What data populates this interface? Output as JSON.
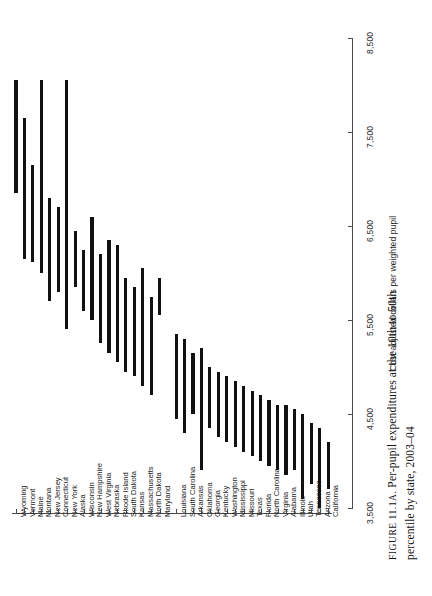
{
  "figure": {
    "caption_label": "FIGURE 11.1A.",
    "caption_line1": "Per-pupil expenditures at the 10th to 50th",
    "caption_line2": "percentile by state, 2003–04"
  },
  "chart_data": {
    "type": "bar",
    "orientation": "range-bars-rotated",
    "xlabel": "",
    "ylabel": "Cost-adjusted dollars per weighted pupil",
    "value_axis_label": "Cost-adjusted dollars per weighted pupil",
    "ylim": [
      3500,
      8500
    ],
    "ticks": [
      "3,500",
      "4,500",
      "5,500",
      "6,500",
      "7,500",
      "8,500"
    ],
    "tick_values": [
      3500,
      4500,
      5500,
      6500,
      7500,
      8500
    ],
    "grid": false,
    "legend": "none",
    "series_note": "Each bar spans the 10th percentile (low) to the 50th percentile (high) of cost-adjusted per-pupil expenditure for unified districts in that state.",
    "categories": [
      "Wyoming",
      "Vermont",
      "Maine",
      "Montana",
      "New Jersey",
      "Connecticut",
      "New York",
      "Alaska",
      "Wisconsin",
      "New Hampshire",
      "West Virginia",
      "Nebraska",
      "Rhode Island",
      "South Dakota",
      "Kansas",
      "Massachusetts",
      "North Dakota",
      "Maryland",
      "Louisiana",
      "South Carolina",
      "Arkansas",
      "Oklahoma",
      "Georgia",
      "Kentucky",
      "Washington",
      "Mississippi",
      "Missouri",
      "Texas",
      "Florida",
      "North Carolina",
      "Virginia",
      "Alabama",
      "Illinois",
      "Utah",
      "Tennessee",
      "Arizona",
      "California"
    ],
    "low_values": [
      6850,
      6150,
      6120,
      6000,
      5700,
      5800,
      5400,
      5850,
      5600,
      5500,
      5250,
      5150,
      5050,
      4950,
      4900,
      4800,
      4700,
      5550,
      4450,
      4300,
      4500,
      3900,
      4350,
      4250,
      4200,
      4150,
      4100,
      4050,
      4000,
      3950,
      3900,
      3850,
      3900,
      3600,
      3750,
      3500,
      3700
    ],
    "high_values": [
      8050,
      7650,
      7150,
      8050,
      6800,
      6700,
      8050,
      6450,
      6250,
      6600,
      6200,
      6350,
      6300,
      5950,
      5850,
      6050,
      5750,
      5950,
      5350,
      5300,
      5150,
      5200,
      5000,
      4950,
      4900,
      4850,
      4800,
      4750,
      4700,
      4650,
      4600,
      4600,
      4550,
      4500,
      4400,
      4350,
      4200
    ],
    "caption": "FIGURE 11.1A. Per-pupil expenditures at the 10th to 50th percentile by state, 2003–04"
  },
  "colors": {
    "bar": "#111111",
    "axis": "#4a4a4a",
    "text": "#1c1c1c",
    "background": "#ffffff"
  }
}
